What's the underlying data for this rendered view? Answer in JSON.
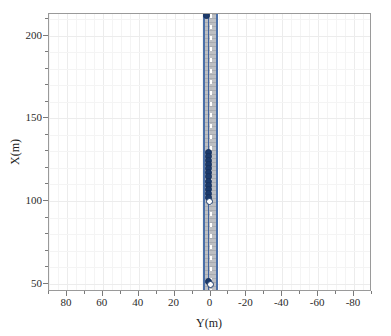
{
  "figure": {
    "background": "#ffffff",
    "axes_color": "#9a9a9a",
    "grid_color": "#ececec"
  },
  "chart_data": {
    "type": "scatter",
    "title": "",
    "xlabel": "Y(m)",
    "ylabel": "X(m)",
    "xlim": [
      90,
      -90
    ],
    "ylim": [
      45,
      213
    ],
    "x_inverted": true,
    "grid": true,
    "legend": null,
    "xticks": [
      80,
      60,
      40,
      20,
      0,
      -20,
      -40,
      -60,
      -80
    ],
    "xticklabels": [
      "80",
      "60",
      "40",
      "20",
      "0",
      "-20",
      "-40",
      "-60",
      "-80"
    ],
    "yticks": [
      50,
      100,
      150,
      200
    ],
    "yticklabels": [
      "50",
      "100",
      "150",
      "200"
    ],
    "series": [
      {
        "name": "vehicle-positions",
        "marker": "circle",
        "color": "#1b3a6b",
        "points": [
          {
            "y": 2.0,
            "x": 212.0
          },
          {
            "y": 1.2,
            "x": 129.5
          },
          {
            "y": 1.2,
            "x": 127.0
          },
          {
            "y": 1.2,
            "x": 124.5
          },
          {
            "y": 1.2,
            "x": 122.0
          },
          {
            "y": 1.2,
            "x": 119.5
          },
          {
            "y": 1.2,
            "x": 117.0
          },
          {
            "y": 1.2,
            "x": 114.5
          },
          {
            "y": 1.2,
            "x": 112.0
          },
          {
            "y": 1.2,
            "x": 109.5
          },
          {
            "y": 1.2,
            "x": 107.0
          },
          {
            "y": 1.2,
            "x": 104.5
          },
          {
            "y": 1.2,
            "x": 102.0
          },
          {
            "y": 0.5,
            "x": 99.5
          },
          {
            "y": 1.2,
            "x": 51.5
          },
          {
            "y": 0.2,
            "x": 49.5
          }
        ]
      }
    ],
    "road": {
      "name": "road-corridor",
      "fill_color": "#b9bcc0",
      "edge_color": "#4a6fa8",
      "lane_marking_color": "#ffffff",
      "center_y": 0.0,
      "half_width_m": 3.6,
      "x_start": 45,
      "x_end": 213
    }
  },
  "labels": {
    "xlabel": "Y(m)",
    "ylabel": "X(m)"
  }
}
